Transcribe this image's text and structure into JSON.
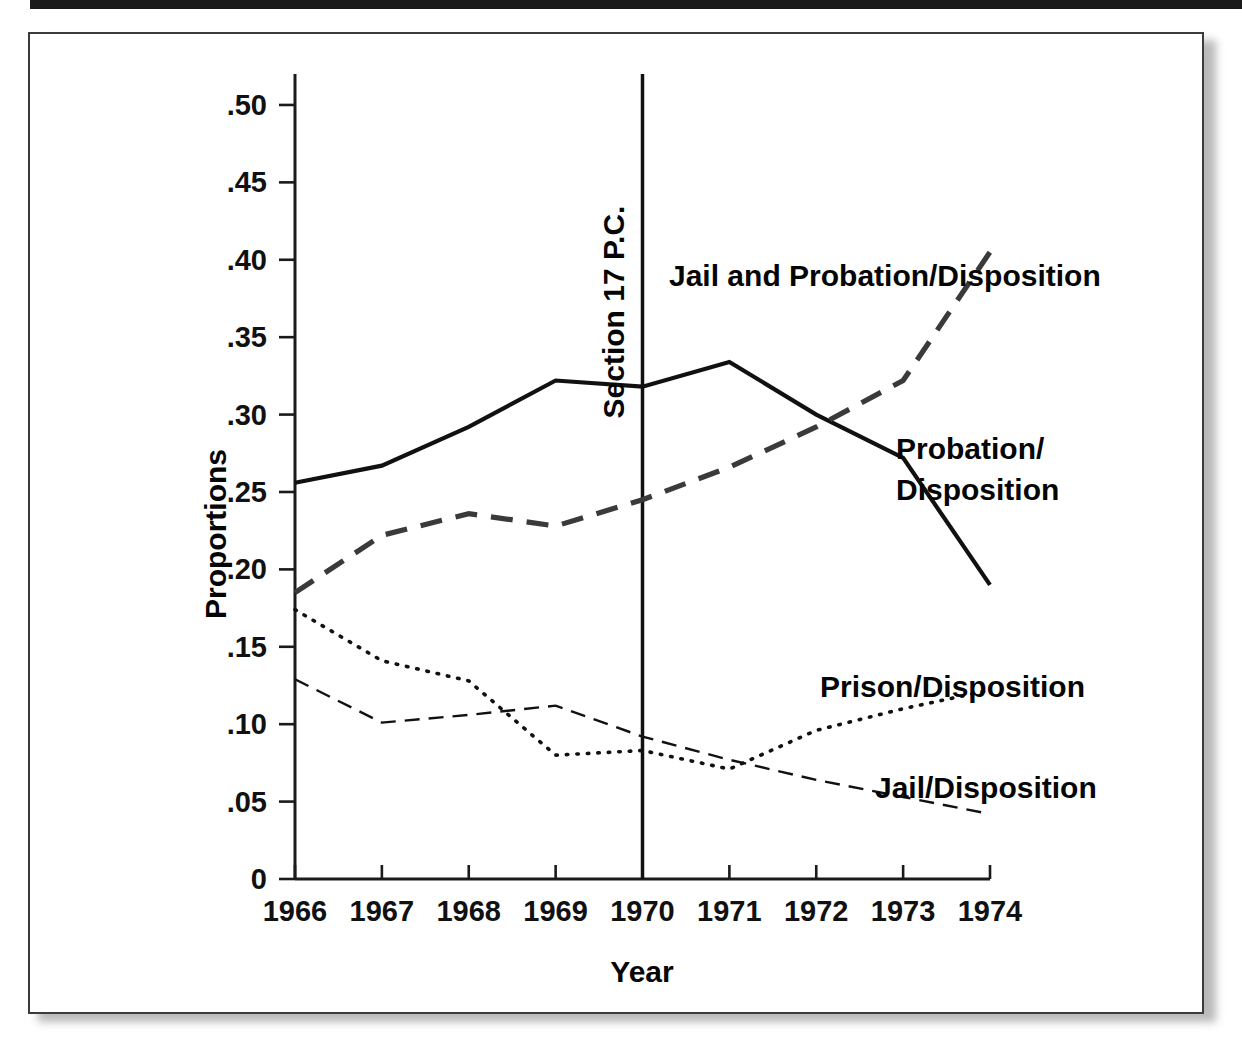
{
  "figure": {
    "frame_border_color": "#3b3b3b",
    "background_color": "#ffffff"
  },
  "annotations": [
    {
      "name": "section-17-pc",
      "text": "Section 17 P.C.",
      "at_year": 1970,
      "orientation": "vertical"
    }
  ],
  "series_labels": {
    "jail_and_probation": "Jail and Probation/Disposition",
    "probation_line1": "Probation/",
    "probation_line2": "Disposition",
    "prison": "Prison/Disposition",
    "jail": "Jail/Disposition"
  },
  "chart_data": {
    "type": "line",
    "title": "",
    "subtitle": "",
    "xlabel": "Year",
    "ylabel": "Proportions",
    "x": [
      1966,
      1967,
      1968,
      1969,
      1970,
      1971,
      1972,
      1973,
      1974
    ],
    "xtick_labels": [
      "1966",
      "1967",
      "1968",
      "1969",
      "1970",
      "1971",
      "1972",
      "1973",
      "1974"
    ],
    "xlim": [
      1966,
      1974
    ],
    "ylim": [
      0,
      0.52
    ],
    "ytick_values": [
      0,
      0.05,
      0.1,
      0.15,
      0.2,
      0.25,
      0.3,
      0.35,
      0.4,
      0.45,
      0.5
    ],
    "ytick_labels": [
      "0",
      ".05",
      ".10",
      ".15",
      ".20",
      ".25",
      ".30",
      ".35",
      ".40",
      ".45",
      ".50"
    ],
    "grid": false,
    "legend_position": "inline-annotations",
    "series": [
      {
        "name": "Probation/Disposition",
        "style": "solid",
        "color": "#111111",
        "values": [
          0.256,
          0.267,
          0.292,
          0.322,
          0.318,
          0.334,
          0.3,
          0.272,
          0.19
        ]
      },
      {
        "name": "Jail and Probation/Disposition",
        "style": "dashed",
        "color": "#3a3a3a",
        "values": [
          0.185,
          0.222,
          0.236,
          0.228,
          0.245,
          0.266,
          0.292,
          0.322,
          0.405
        ]
      },
      {
        "name": "Prison/Disposition",
        "style": "dotted",
        "color": "#111111",
        "values": [
          0.174,
          0.141,
          0.128,
          0.08,
          0.083,
          0.071,
          0.096,
          0.11,
          0.122
        ]
      },
      {
        "name": "Jail/Disposition",
        "style": "thin-dashed",
        "color": "#111111",
        "values": [
          0.129,
          0.101,
          0.106,
          0.112,
          0.092,
          0.077,
          0.064,
          0.053,
          0.042
        ]
      }
    ],
    "annotation_line": {
      "label": "Section 17 P.C.",
      "x": 1970
    }
  }
}
